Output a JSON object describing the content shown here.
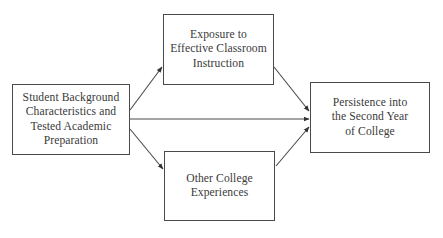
{
  "diagram": {
    "type": "flow",
    "nodes": [
      {
        "id": "student",
        "label": "Student Background\nCharacteristics and\nTested Academic\nPreparation"
      },
      {
        "id": "exposure",
        "label": "Exposure to\nEffective Classroom\nInstruction"
      },
      {
        "id": "other",
        "label": "Other College\nExperiences"
      },
      {
        "id": "persistence",
        "label": "Persistence into\nthe Second Year\nof College"
      }
    ],
    "edges": [
      {
        "from": "student",
        "to": "exposure"
      },
      {
        "from": "student",
        "to": "persistence"
      },
      {
        "from": "student",
        "to": "other"
      },
      {
        "from": "exposure",
        "to": "persistence"
      },
      {
        "from": "other",
        "to": "persistence"
      }
    ],
    "colors": {
      "stroke": "#4a4a4a",
      "text": "#3a3a3a",
      "background": "#ffffff"
    }
  }
}
